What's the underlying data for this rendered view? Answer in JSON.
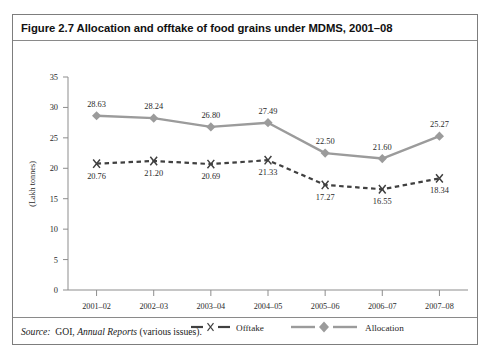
{
  "figure": {
    "title": "Figure 2.7 Allocation and offtake of food grains under MDMS, 2001–08",
    "source_label": "Source:",
    "source_prefix": "GOI,",
    "source_work": "Annual Reports",
    "source_suffix": "(various issues)."
  },
  "colors": {
    "allocation": "#9b9b9b",
    "offtake": "#404040",
    "axis": "#8d8d8d",
    "frame": "#7d7d7d",
    "text": "#1a1a1a"
  },
  "chart_data": {
    "type": "line",
    "title": "Figure 2.7 Allocation and offtake of food grains under MDMS, 2001–08",
    "xlabel": "",
    "ylabel": "(Lakh tonnes)",
    "ylim": [
      0,
      35
    ],
    "yticks": [
      "0",
      "5",
      "10",
      "15",
      "20",
      "25",
      "30",
      "35"
    ],
    "ytick_values": [
      0,
      5,
      10,
      15,
      20,
      25,
      30,
      35
    ],
    "grid": false,
    "legend_position": "bottom",
    "categories": [
      "2001–02",
      "2002–03",
      "2003–04",
      "2004–05",
      "2005–06",
      "2006–07",
      "2007–08"
    ],
    "series": [
      {
        "name": "Offtake",
        "marker": "x",
        "linestyle": "dashed",
        "color": "#404040",
        "values": [
          20.76,
          21.2,
          20.69,
          21.33,
          17.27,
          16.55,
          18.34
        ],
        "labels": [
          "20.76",
          "21.20",
          "20.69",
          "21.33",
          "17.27",
          "16.55",
          "18.34"
        ]
      },
      {
        "name": "Allocation",
        "marker": "diamond",
        "linestyle": "solid",
        "color": "#9b9b9b",
        "values": [
          28.63,
          28.24,
          26.8,
          27.49,
          22.5,
          21.6,
          25.27
        ],
        "labels": [
          "28.63",
          "28.24",
          "26.80",
          "27.49",
          "22.50",
          "21.60",
          "25.27"
        ]
      }
    ]
  }
}
